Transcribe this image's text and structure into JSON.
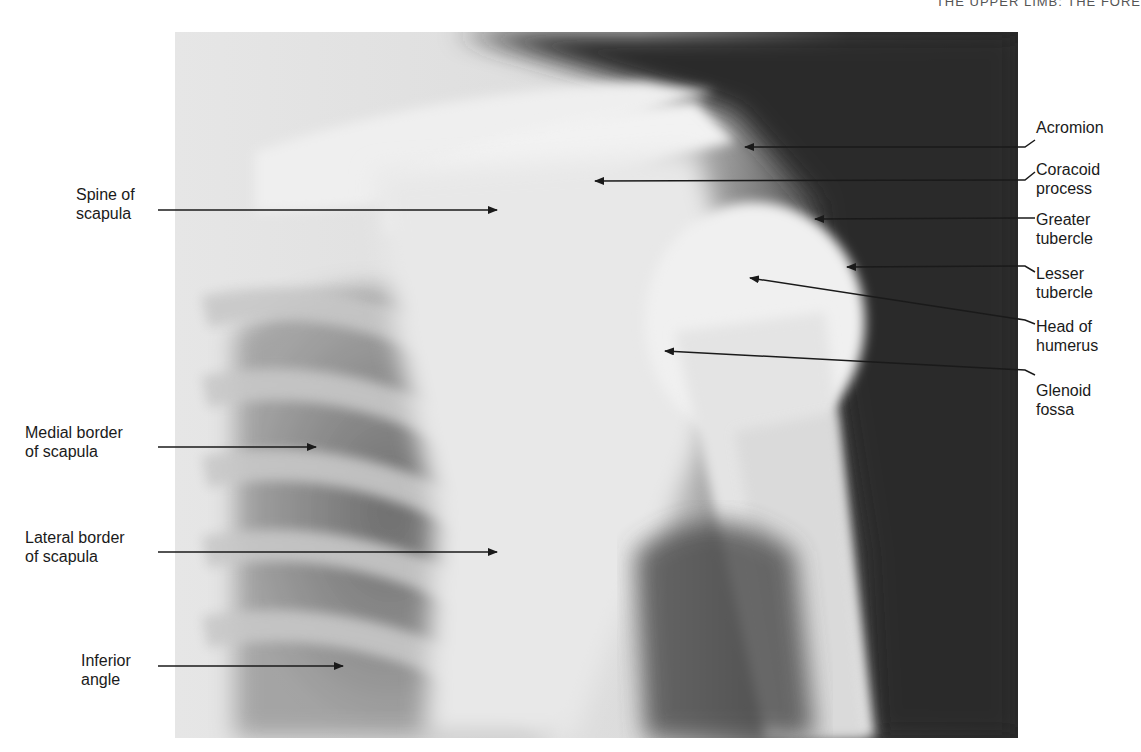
{
  "page": {
    "running_head": "THE UPPER LIMB: THE FORE"
  },
  "figure": {
    "colors": {
      "paper": "#ffffff",
      "ink": "#1a1a1a",
      "film_dark": "#262626",
      "bone_light": "#ececec"
    }
  },
  "labels": {
    "right": [
      {
        "lines": [
          "Acromion"
        ]
      },
      {
        "lines": [
          "Coracoid",
          "process"
        ]
      },
      {
        "lines": [
          "Greater",
          "tubercle"
        ]
      },
      {
        "lines": [
          "Lesser",
          "tubercle"
        ]
      },
      {
        "lines": [
          "Head of",
          "humerus"
        ]
      },
      {
        "lines": [
          "Glenoid",
          "fossa"
        ]
      }
    ],
    "left": [
      {
        "lines": [
          "Spine of",
          "scapula"
        ]
      },
      {
        "lines": [
          "Medial border",
          "of scapula"
        ]
      },
      {
        "lines": [
          "Lateral border",
          "of scapula"
        ]
      },
      {
        "lines": [
          "Inferior",
          "angle"
        ]
      }
    ]
  }
}
